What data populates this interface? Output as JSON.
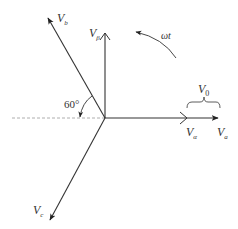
{
  "diagram": {
    "type": "phasor-diagram",
    "colors": {
      "line": "#333333",
      "dashed": "#999999",
      "background": "#ffffff"
    },
    "origin": {
      "x": 105,
      "y": 118
    },
    "vectors": [
      {
        "id": "Va",
        "label_main": "V",
        "label_sub": "a",
        "head": "filled",
        "end": {
          "x": 218,
          "y": 118
        }
      },
      {
        "id": "Valpha",
        "label_main": "V",
        "label_sub": "α",
        "head": "open",
        "end": {
          "x": 186,
          "y": 118
        }
      },
      {
        "id": "Vbeta",
        "label_main": "V",
        "label_sub": "β",
        "head": "open",
        "end": {
          "x": 105,
          "y": 33
        }
      },
      {
        "id": "Vb",
        "label_main": "V",
        "label_sub": "b",
        "head": "filled",
        "end": {
          "x": 48,
          "y": 18
        }
      },
      {
        "id": "Vc",
        "label_main": "V",
        "label_sub": "c",
        "head": "filled",
        "end": {
          "x": 50,
          "y": 220
        }
      }
    ],
    "annotations": {
      "angle_label": "60°",
      "rotation_label": "ωt",
      "brace_label_main": "V",
      "brace_label_sub": "0"
    }
  }
}
